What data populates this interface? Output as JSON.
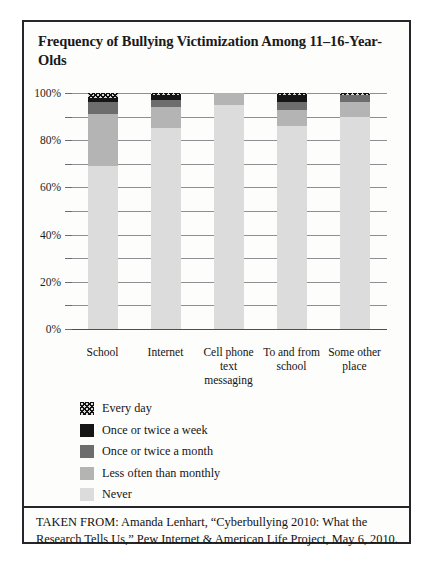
{
  "figure": {
    "title": "Frequency of Bullying Victimization Among 11–16-Year-Olds",
    "caption": "TAKEN FROM: Amanda Lenhart, “Cyberbullying 2010: What the Research Tells Us,”  Pew Internet & American Life Project, May 6, 2010."
  },
  "chart_data": {
    "type": "bar",
    "stacked": true,
    "stack_mode": "percent",
    "title": "Frequency of Bullying Victimization Among 11–16-Year-Olds",
    "xlabel": "",
    "ylabel": "",
    "ylim": [
      0,
      100
    ],
    "yticks": [
      0,
      10,
      20,
      30,
      40,
      50,
      60,
      70,
      80,
      90,
      100
    ],
    "ytick_labels": [
      "0%",
      "",
      "20%",
      "",
      "40%",
      "",
      "60%",
      "",
      "80%",
      "",
      "100%"
    ],
    "grid": true,
    "legend_position": "below-plot-left",
    "categories": [
      "School",
      "Internet",
      "Cell phone text messaging",
      "To and from school",
      "Some other place"
    ],
    "series": [
      {
        "name": "Never",
        "swatch": "#dcdcdc",
        "pattern": "solid",
        "values": [
          69,
          85,
          95,
          86,
          90
        ]
      },
      {
        "name": "Less often than monthly",
        "swatch": "#b4b4b4",
        "pattern": "solid",
        "values": [
          22,
          9,
          5,
          7,
          6
        ]
      },
      {
        "name": "Once or twice a month",
        "swatch": "#6d6d6d",
        "pattern": "solid",
        "values": [
          5,
          3,
          0,
          3,
          3
        ]
      },
      {
        "name": "Once or twice a week",
        "swatch": "#151515",
        "pattern": "solid",
        "values": [
          2,
          2,
          0,
          3,
          0
        ]
      },
      {
        "name": "Every day",
        "swatch": "#d8d8d8",
        "pattern": "hatch",
        "values": [
          2,
          1,
          0,
          1,
          1
        ]
      }
    ]
  },
  "legend": {
    "items": [
      {
        "label": "Every day"
      },
      {
        "label": "Once or twice a week"
      },
      {
        "label": "Once or twice a month"
      },
      {
        "label": "Less often than monthly"
      },
      {
        "label": "Never"
      }
    ]
  },
  "axis": {
    "y_labels": [
      "100%",
      "80%",
      "60%",
      "40%",
      "20%",
      "0%"
    ]
  },
  "x_labels": [
    {
      "line1": "School",
      "line2": ""
    },
    {
      "line1": "Internet",
      "line2": ""
    },
    {
      "line1": "Cell phone",
      "line2": "text messaging"
    },
    {
      "line1": "To and from",
      "line2": "school"
    },
    {
      "line1": "Some other",
      "line2": "place"
    }
  ]
}
